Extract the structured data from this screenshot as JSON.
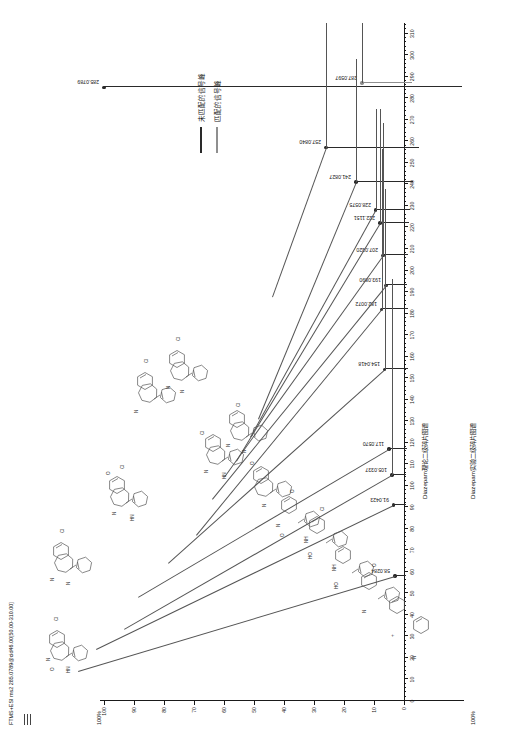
{
  "figure": {
    "title": "FTMS+ESI ms2 285.0789@cid46.00[50.00-310.00]",
    "top_panel_label": "Diazepam理论二级碎片图谱",
    "bottom_panel_label": "Diazepam实验二级碎片图谱",
    "top_pct_label": "100%",
    "bottom_pct_label": "100%"
  },
  "legend": {
    "items": [
      {
        "label": "未匹配的信号峰",
        "color": "#2a2a2a"
      },
      {
        "label": "匹配的信号峰",
        "color": "#8f8f8f"
      }
    ]
  },
  "chart_data": {
    "type": "bar",
    "title": "FTMS+ESI ms2 285.0789@cid46.00[50.00-310.00]",
    "xlabel": "m/z",
    "ylabel": "Relative Abundance (%)",
    "xlim": [
      0,
      315
    ],
    "ylim": [
      0,
      100
    ],
    "grid": false,
    "legend_position": "right",
    "xticks": [
      0,
      10,
      20,
      30,
      40,
      50,
      60,
      70,
      80,
      90,
      100,
      110,
      120,
      130,
      140,
      150,
      160,
      170,
      180,
      190,
      200,
      210,
      220,
      230,
      240,
      250,
      260,
      270,
      280,
      290,
      300,
      310
    ],
    "yticks": [
      0,
      10,
      20,
      30,
      40,
      50,
      60,
      70,
      80,
      90,
      100
    ],
    "series": [
      {
        "name": "未匹配的信号峰",
        "color": "#2a2a2a",
        "points": [
          {
            "mz": 285.0789,
            "label": "285.0789",
            "intensity": 100.0,
            "matched": false
          },
          {
            "mz": 257.084,
            "label": "257.0840",
            "intensity": 26.0,
            "matched": false
          },
          {
            "mz": 241.0827,
            "label": "241.0827",
            "intensity": 16.0,
            "matched": false
          },
          {
            "mz": 228.0575,
            "label": "228.0575",
            "intensity": 9.5,
            "matched": false
          },
          {
            "mz": 222.1151,
            "label": "222.1151",
            "intensity": 8.0,
            "matched": false
          },
          {
            "mz": 207.032,
            "label": "207.0320",
            "intensity": 7.0,
            "matched": false
          },
          {
            "mz": 193.089,
            "label": "193.0890",
            "intensity": 6.0,
            "matched": false
          },
          {
            "mz": 182.0072,
            "label": "182.0072",
            "intensity": 7.5,
            "matched": false
          },
          {
            "mz": 154.0418,
            "label": "154.0418",
            "intensity": 6.5,
            "matched": false
          },
          {
            "mz": 117.057,
            "label": "117.0570",
            "intensity": 5.0,
            "matched": false
          },
          {
            "mz": 105.0337,
            "label": "105.0337",
            "intensity": 4.0,
            "matched": false
          },
          {
            "mz": 91.0423,
            "label": "91.0423",
            "intensity": 3.5,
            "matched": false
          },
          {
            "mz": 58.0284,
            "label": "58.0284",
            "intensity": 3.0,
            "matched": false
          }
        ]
      },
      {
        "name": "匹配的信号峰",
        "color": "#8f8f8f",
        "points": [
          {
            "mz": 287.0597,
            "label": "287.0597",
            "intensity": 14.0,
            "matched": true
          }
        ]
      }
    ],
    "annotations": [
      "285.0789",
      "287.0597",
      "257.0840",
      "241.0827",
      "228.0575",
      "222.1151",
      "207.0320",
      "193.0890",
      "182.0072",
      "154.0418",
      "117.0570",
      "105.0337",
      "91.0423",
      "58.0284"
    ]
  }
}
